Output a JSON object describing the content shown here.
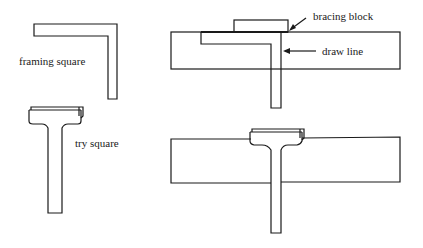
{
  "figure": {
    "panels": [
      {
        "id": "framing-square-tool",
        "label": "framing square"
      },
      {
        "id": "try-square-tool",
        "label": "try square"
      },
      {
        "id": "framing-square-use",
        "annotations": [
          "bracing block",
          "draw line"
        ]
      },
      {
        "id": "try-square-use"
      }
    ]
  },
  "labels": {
    "framing_square": "framing square",
    "try_square": "try square",
    "bracing_block": "bracing block",
    "draw_line": "draw line"
  },
  "colors": {
    "stroke": "#1a1a1a",
    "background": "#ffffff"
  }
}
